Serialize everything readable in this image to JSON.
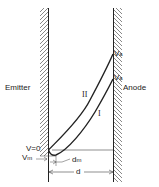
{
  "diagram": {
    "left_electrode": "Emitter",
    "right_electrode": "Anode",
    "curve_upper": "II",
    "curve_lower": "I",
    "voltage_top": {
      "main": "V",
      "sub": "a"
    },
    "voltage_mid": {
      "main": "V",
      "sub": "a"
    },
    "zero_voltage": "V=0",
    "min_voltage": {
      "main": "V",
      "sub": "m"
    },
    "min_distance": {
      "main": "d",
      "sub": "m"
    },
    "gap_distance": "d"
  },
  "colors": {
    "line": "#222222",
    "background": "#ffffff"
  }
}
